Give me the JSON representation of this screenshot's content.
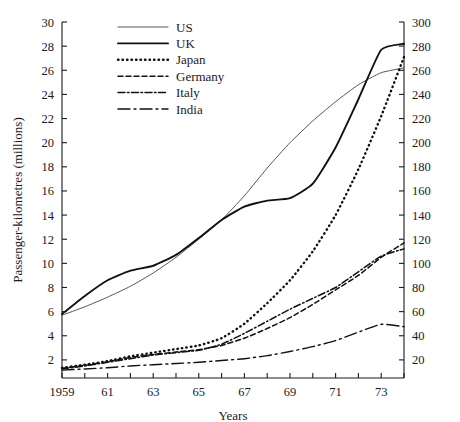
{
  "chart_data": {
    "type": "line",
    "title": "",
    "xlabel": "Years",
    "ylabel": "Passenger-kilometres (millions)",
    "ylabel_right": "",
    "grid": false,
    "legend_position": "top-center",
    "xlim": [
      1959,
      1974
    ],
    "ylim": [
      0.5,
      30
    ],
    "ylim_right": [
      5,
      300
    ],
    "x": [
      1959,
      1960,
      1961,
      1962,
      1963,
      1964,
      1965,
      1966,
      1967,
      1968,
      1969,
      1970,
      1971,
      1972,
      1973,
      1974
    ],
    "xtick_labels": [
      "1959",
      "",
      "61",
      "",
      "63",
      "",
      "65",
      "",
      "67",
      "",
      "69",
      "",
      "71",
      "",
      "73",
      ""
    ],
    "ytick_labels_left": [
      "2",
      "4",
      "6",
      "8",
      "10",
      "12",
      "14",
      "16",
      "18",
      "20",
      "22",
      "24",
      "26",
      "28",
      "30"
    ],
    "ytick_values_left": [
      2,
      4,
      6,
      8,
      10,
      12,
      14,
      16,
      18,
      20,
      22,
      24,
      26,
      28,
      30
    ],
    "ytick_labels_right": [
      "20",
      "40",
      "60",
      "80",
      "100",
      "120",
      "140",
      "160",
      "180",
      "200",
      "220",
      "240",
      "260",
      "280",
      "300"
    ],
    "ytick_values_right": [
      20,
      40,
      60,
      80,
      100,
      120,
      140,
      160,
      180,
      200,
      220,
      240,
      260,
      280,
      300
    ],
    "series": [
      {
        "name": "US",
        "style": "solid-thin",
        "color": "#555555",
        "width": 1.0,
        "dash": "",
        "values": [
          5.7,
          6.4,
          7.2,
          8.1,
          9.2,
          10.5,
          12.0,
          13.6,
          15.6,
          17.9,
          20.0,
          21.8,
          23.4,
          24.8,
          25.8,
          26.2
        ]
      },
      {
        "name": "UK",
        "style": "solid-thick",
        "color": "#111111",
        "width": 1.9,
        "dash": "",
        "values": [
          5.8,
          7.3,
          8.6,
          9.4,
          9.8,
          10.7,
          12.1,
          13.6,
          14.7,
          15.2,
          15.4,
          16.6,
          19.6,
          23.6,
          27.7,
          28.2
        ]
      },
      {
        "name": "Japan",
        "style": "dotted",
        "color": "#111111",
        "width": 2.4,
        "dash": "0.5 4",
        "values": [
          1.35,
          1.6,
          1.9,
          2.3,
          2.6,
          2.9,
          3.2,
          3.8,
          5.0,
          6.7,
          8.6,
          11.0,
          14.0,
          17.8,
          22.2,
          27.1
        ]
      },
      {
        "name": "Germany",
        "style": "dashed",
        "color": "#111111",
        "width": 1.5,
        "dash": "5 3",
        "values": [
          1.3,
          1.55,
          1.85,
          2.2,
          2.45,
          2.65,
          2.85,
          3.2,
          3.8,
          4.6,
          5.5,
          6.6,
          7.8,
          9.0,
          10.5,
          11.7
        ]
      },
      {
        "name": "Italy",
        "style": "dash-dot",
        "color": "#111111",
        "width": 1.5,
        "dash": "7 2.5 1.5 2.5",
        "values": [
          1.25,
          1.5,
          1.8,
          2.1,
          2.4,
          2.6,
          2.8,
          3.3,
          4.2,
          5.2,
          6.2,
          7.1,
          8.0,
          9.3,
          10.6,
          11.2
        ]
      },
      {
        "name": "India",
        "style": "long-dash-dot",
        "color": "#111111",
        "width": 1.4,
        "dash": "12 4 2 4",
        "values": [
          1.15,
          1.25,
          1.35,
          1.5,
          1.6,
          1.7,
          1.8,
          1.95,
          2.1,
          2.35,
          2.7,
          3.1,
          3.6,
          4.3,
          4.95,
          4.75
        ]
      }
    ]
  },
  "legend": {
    "entries": [
      {
        "label": "US"
      },
      {
        "label": "UK"
      },
      {
        "label": "Japan"
      },
      {
        "label": "Germany"
      },
      {
        "label": "Italy"
      },
      {
        "label": "India"
      }
    ]
  }
}
